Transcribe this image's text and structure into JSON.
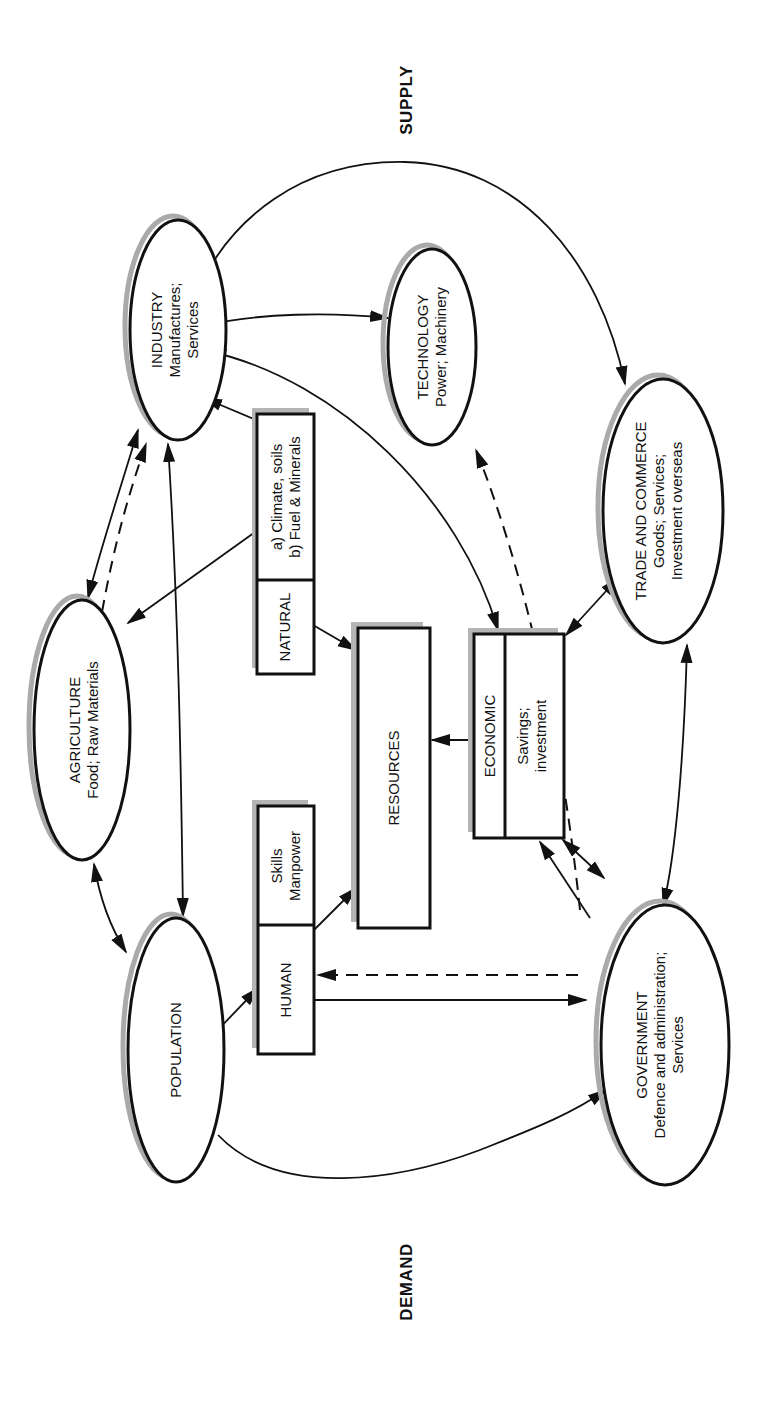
{
  "diagram": {
    "orientation": "rotated-90-ccw",
    "axis_labels": {
      "supply": "SUPPLY",
      "demand": "DEMAND"
    },
    "nodes": {
      "industry": {
        "shape": "ellipse",
        "cx": 178,
        "cy": 330,
        "rx": 48,
        "ry": 110,
        "lines": [
          "INDUSTRY",
          "Manufactures;",
          "Services"
        ]
      },
      "technology": {
        "shape": "ellipse",
        "cx": 432,
        "cy": 347,
        "rx": 44,
        "ry": 98,
        "lines": [
          "TECHNOLOGY",
          "Power; Machinery"
        ]
      },
      "trade": {
        "shape": "ellipse",
        "cx": 663,
        "cy": 511,
        "rx": 60,
        "ry": 132,
        "lines": [
          "TRADE AND COMMERCE",
          "Goods; Services;",
          "Investment overseas"
        ]
      },
      "agriculture": {
        "shape": "ellipse",
        "cx": 82,
        "cy": 730,
        "rx": 48,
        "ry": 130,
        "lines": [
          "AGRICULTURE",
          "Food; Raw Materials"
        ]
      },
      "population": {
        "shape": "ellipse",
        "cx": 176,
        "cy": 1050,
        "rx": 48,
        "ry": 132,
        "lines": [
          "POPULATION"
        ]
      },
      "government": {
        "shape": "ellipse",
        "cx": 665,
        "cy": 1045,
        "rx": 64,
        "ry": 140,
        "lines": [
          "GOVERNMENT",
          "Defence and administration;",
          "Services"
        ]
      }
    },
    "boxes": {
      "natural": {
        "x": 257,
        "y": 414,
        "w": 57,
        "h": 260,
        "split_y": 580,
        "left_label": "NATURAL",
        "right_lines": [
          "a) Climate, soils",
          "b) Fuel & Minerals"
        ]
      },
      "resources": {
        "x": 358,
        "y": 628,
        "w": 72,
        "h": 300,
        "label": "RESOURCES"
      },
      "economic": {
        "x": 474,
        "y": 634,
        "w": 90,
        "h": 204,
        "split_x": 505,
        "left_label": "ECONOMIC",
        "right_lines": [
          "Savings;",
          "investment"
        ]
      },
      "human": {
        "x": 258,
        "y": 806,
        "w": 56,
        "h": 248,
        "split_y": 925,
        "left_label": "HUMAN",
        "right_lines": [
          "Skills",
          "Manpower"
        ]
      }
    },
    "edges": [
      {
        "from": "trade",
        "to": "industry",
        "style": "solid",
        "arrows": "both",
        "label": "trade-industry"
      },
      {
        "from": "industry",
        "to": "technology",
        "style": "solid",
        "arrows": "both",
        "label": "industry-technology"
      },
      {
        "from": "industry",
        "to": "economic",
        "style": "solid",
        "arrows": "both",
        "label": "industry-economic"
      },
      {
        "from": "natural",
        "to": "industry",
        "style": "solid",
        "arrows": "end",
        "label": "natural-industry"
      },
      {
        "from": "natural",
        "to": "agriculture",
        "style": "solid",
        "arrows": "end",
        "label": "natural-agriculture"
      },
      {
        "from": "natural",
        "to": "resources",
        "style": "solid",
        "arrows": "end",
        "label": "natural-resources"
      },
      {
        "from": "industry",
        "to": "agriculture",
        "style": "solid",
        "arrows": "both",
        "label": "industry-agriculture"
      },
      {
        "from": "agriculture",
        "to": "industry",
        "style": "dashed",
        "arrows": "end",
        "label": "agriculture-industry-dashed"
      },
      {
        "from": "population",
        "to": "industry",
        "style": "solid",
        "arrows": "both",
        "label": "population-industry"
      },
      {
        "from": "agriculture",
        "to": "population",
        "style": "solid",
        "arrows": "both",
        "label": "agriculture-population"
      },
      {
        "from": "government",
        "to": "technology",
        "style": "dashed",
        "arrows": "end",
        "label": "government-technology-dashed"
      },
      {
        "from": "economic",
        "to": "trade",
        "style": "solid",
        "arrows": "both",
        "label": "economic-trade"
      },
      {
        "from": "economic",
        "to": "resources",
        "style": "solid",
        "arrows": "end",
        "label": "economic-resources"
      },
      {
        "from": "trade",
        "to": "government",
        "style": "solid",
        "arrows": "both",
        "label": "trade-government"
      },
      {
        "from": "economic",
        "to": "government",
        "style": "solid",
        "arrows": "both",
        "label": "economic-government"
      },
      {
        "from": "human",
        "to": "resources",
        "style": "solid",
        "arrows": "end",
        "label": "human-resources"
      },
      {
        "from": "population",
        "to": "human",
        "style": "solid",
        "arrows": "end",
        "label": "population-human"
      },
      {
        "from": "human",
        "to": "government",
        "style": "solid",
        "arrows": "end",
        "label": "human-government"
      },
      {
        "from": "government",
        "to": "human",
        "style": "dashed",
        "arrows": "end",
        "label": "government-human-dashed"
      },
      {
        "from": "population",
        "to": "government",
        "style": "solid",
        "arrows": "end",
        "label": "population-government"
      }
    ]
  },
  "colors": {
    "ink": "#111111",
    "shadow": "#aaaaaa",
    "background": "#ffffff"
  }
}
